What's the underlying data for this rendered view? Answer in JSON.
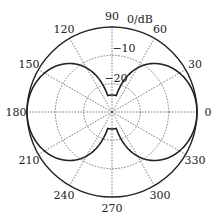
{
  "chart_data": {
    "type": "polar",
    "title": "",
    "radial_unit_label": "0/dB",
    "radial_ticks": [
      {
        "label": "0",
        "value": 0
      },
      {
        "label": "−10",
        "value": -10
      },
      {
        "label": "−20",
        "value": -20
      }
    ],
    "radial_range": [
      -30,
      0
    ],
    "angular_ticks": [
      "0",
      "30",
      "60",
      "90",
      "120",
      "150",
      "180",
      "210",
      "240",
      "270",
      "300",
      "330"
    ],
    "angular_tick_values_deg": [
      0,
      30,
      60,
      90,
      120,
      150,
      180,
      210,
      240,
      270,
      300,
      330
    ],
    "grid": true,
    "series": [
      {
        "name": "radiation pattern",
        "formula": "40*log10(|cos(theta)|), floored at -24 dB",
        "theta_deg": [
          0,
          15,
          30,
          45,
          60,
          75,
          90,
          105,
          120,
          135,
          150,
          165,
          180,
          195,
          210,
          225,
          240,
          255,
          270,
          285,
          300,
          315,
          330,
          345
        ],
        "values_db": [
          0,
          -0.6,
          -2.5,
          -6.0,
          -12.0,
          -23.4,
          -24,
          -23.4,
          -12.0,
          -6.0,
          -2.5,
          -0.6,
          0,
          -0.6,
          -2.5,
          -6.0,
          -12.0,
          -23.4,
          -24,
          -23.4,
          -12.0,
          -6.0,
          -2.5,
          -0.6
        ]
      }
    ],
    "colors": {
      "line": "#222222",
      "grid": "#555555",
      "background": "#ffffff"
    }
  }
}
